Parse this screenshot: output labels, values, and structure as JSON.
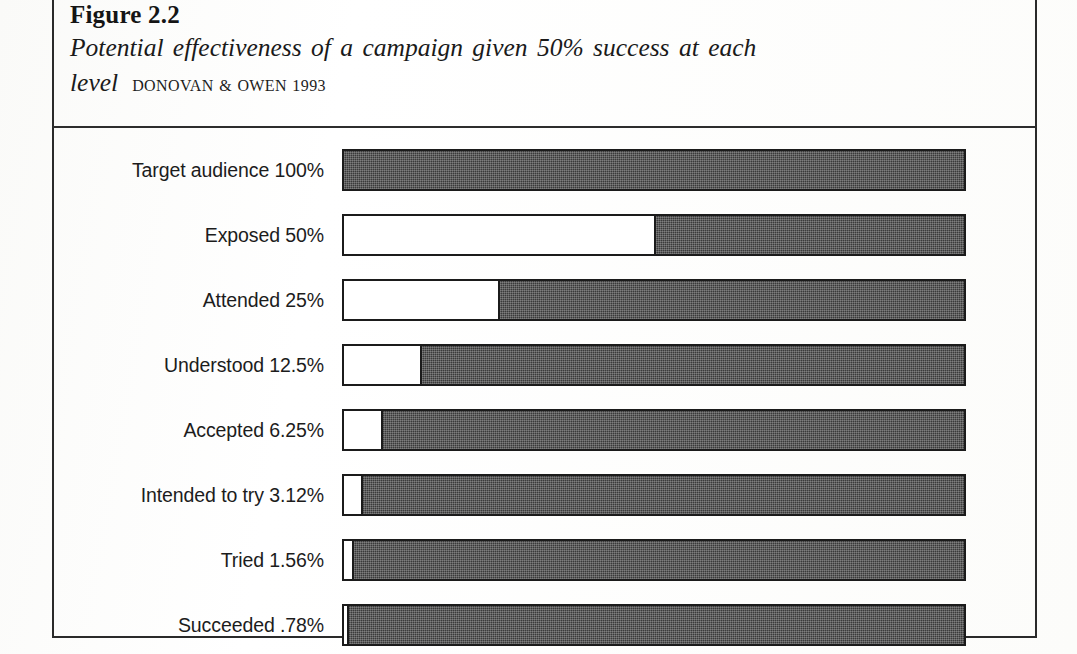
{
  "figure": {
    "number": "Figure 2.2",
    "title": "Potential effectiveness of a campaign given 50% success at each level",
    "source": "DONOVAN & OWEN 1993"
  },
  "colors": {
    "fill": "#3a3a3a",
    "unfilled": "#ffffff",
    "outline": "#1b1b1b",
    "frame": "#2a2a2a",
    "text": "#1c1c1c",
    "page": "#fdfdfc"
  },
  "chart_data": {
    "type": "bar",
    "orientation": "horizontal",
    "title": "Potential effectiveness of a campaign given 50% success at each level",
    "subtitle": "Figure 2.2",
    "source": "DONOVAN & OWEN 1993",
    "xlabel": "",
    "ylabel": "",
    "xlim": [
      0,
      100
    ],
    "grid": false,
    "legend": false,
    "note": "Each bar's white (unfilled) left segment is proportional to the stated percentage of the full track; the remainder is shaded.",
    "categories": [
      "Target audience",
      "Exposed",
      "Attended",
      "Understood",
      "Accepted",
      "Intended to try",
      "Tried",
      "Succeeded"
    ],
    "values": [
      100,
      50,
      25,
      12.5,
      6.25,
      3.12,
      1.56,
      0.78
    ],
    "value_labels": [
      "100%",
      "50%",
      "25%",
      "12.5%",
      "6.25%",
      "3.12%",
      "1.56%",
      ".78%"
    ],
    "bars": [
      {
        "label": "Target audience 100%",
        "category": "Target audience",
        "value": 100,
        "value_label": "100%",
        "unfilled_pct": 100
      },
      {
        "label": "Exposed 50%",
        "category": "Exposed",
        "value": 50,
        "value_label": "50%",
        "unfilled_pct": 50
      },
      {
        "label": "Attended 25%",
        "category": "Attended",
        "value": 25,
        "value_label": "25%",
        "unfilled_pct": 25
      },
      {
        "label": "Understood 12.5%",
        "category": "Understood",
        "value": 12.5,
        "value_label": "12.5%",
        "unfilled_pct": 12.5
      },
      {
        "label": "Accepted 6.25%",
        "category": "Accepted",
        "value": 6.25,
        "value_label": "6.25%",
        "unfilled_pct": 6.25
      },
      {
        "label": "Intended to try 3.12%",
        "category": "Intended to try",
        "value": 3.12,
        "value_label": "3.12%",
        "unfilled_pct": 3.12
      },
      {
        "label": "Tried 1.56%",
        "category": "Tried",
        "value": 1.56,
        "value_label": "1.56%",
        "unfilled_pct": 1.56
      },
      {
        "label": "Succeeded .78%",
        "category": "Succeeded",
        "value": 0.78,
        "value_label": ".78%",
        "unfilled_pct": 0.78
      }
    ]
  }
}
